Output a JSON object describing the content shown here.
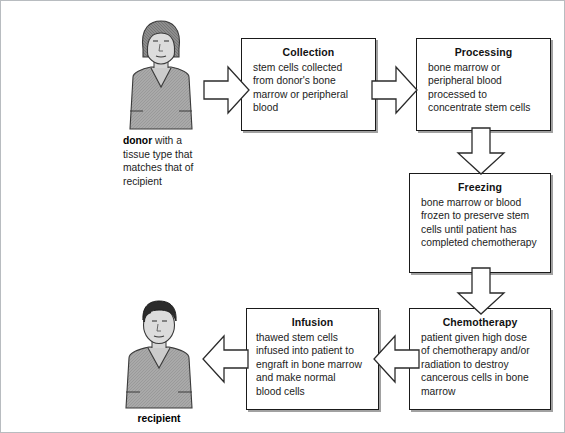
{
  "figure": {
    "background": "#ffffff",
    "frame_border_color": "#b8bcc0",
    "box_border_color": "#1a1a1a",
    "text_color": "#1c1c1c"
  },
  "people": {
    "donor": {
      "label_bold": "donor",
      "label_rest": " with a",
      "caption_lines": [
        "tissue type that",
        "matches that of",
        "recipient"
      ],
      "hair_color": "#8f8f8f",
      "skin_color": "#d8d8d8",
      "shirt_color": "#a8a8a8"
    },
    "recipient": {
      "label_bold": "recipient",
      "hair_color": "#2e2e2e",
      "skin_color": "#d8d8d8",
      "shirt_color": "#a8a8a8"
    }
  },
  "steps": [
    {
      "id": "collection",
      "title": "Collection",
      "lines": [
        "stem cells collected",
        "from donor's bone",
        "marrow or peripheral",
        "blood"
      ]
    },
    {
      "id": "processing",
      "title": "Processing",
      "lines": [
        "bone marrow or",
        "peripheral blood",
        "processed to",
        "concentrate stem cells"
      ]
    },
    {
      "id": "freezing",
      "title": "Freezing",
      "lines": [
        "bone marrow or blood",
        "frozen to preserve stem",
        "cells until patient has",
        "completed chemotherapy"
      ]
    },
    {
      "id": "chemotherapy",
      "title": "Chemotherapy",
      "lines": [
        "patient given high dose",
        "of chemotherapy and/or",
        "radiation to destroy",
        "cancerous cells in bone",
        "marrow"
      ]
    },
    {
      "id": "infusion",
      "title": "Infusion",
      "lines": [
        "thawed stem cells",
        "infused into patient to",
        "engraft in bone marrow",
        "and make normal",
        "blood cells"
      ]
    }
  ],
  "arrows": [
    {
      "id": "donor-to-collection",
      "direction": "right"
    },
    {
      "id": "collection-to-processing",
      "direction": "right"
    },
    {
      "id": "processing-to-freezing",
      "direction": "down"
    },
    {
      "id": "freezing-to-chemotherapy",
      "direction": "down"
    },
    {
      "id": "chemotherapy-to-infusion",
      "direction": "left"
    },
    {
      "id": "infusion-to-recipient",
      "direction": "left"
    }
  ]
}
